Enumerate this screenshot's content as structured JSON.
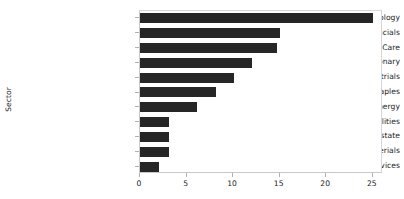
{
  "chart_data": {
    "type": "bar",
    "orientation": "horizontal",
    "title": "",
    "xlabel": "",
    "ylabel": "Sector",
    "categories": [
      "Information Technology",
      "Financials",
      "Health Care",
      "Consumer Discretionary",
      "Industrials",
      "Consumer Staples",
      "Energy",
      "Utilities",
      "Real Estate",
      "Materials",
      "Telecommunication Services"
    ],
    "values": [
      25,
      15,
      14.7,
      12,
      10.1,
      8.2,
      6.1,
      3.1,
      3.1,
      3.1,
      2
    ],
    "xlim": [
      0,
      26.1
    ],
    "xticks": [
      0,
      5,
      10,
      15,
      20,
      25
    ],
    "xticklabels": [
      "0",
      "5",
      "10",
      "15",
      "20",
      "25"
    ],
    "grid": false,
    "legend": false,
    "bar_color": "#262626",
    "background_color": "#ffffff",
    "axis_color": "#c9c9c9"
  }
}
